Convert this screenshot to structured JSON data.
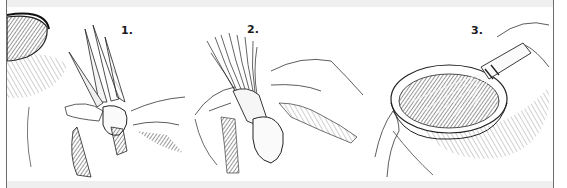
{
  "illustration": {
    "steps": [
      {
        "number": "1.",
        "subject": "hands tying husk leaves into a bundle beside a bowl"
      },
      {
        "number": "2.",
        "subject": "hands splitting the tied bundle into fine strands"
      },
      {
        "number": "3.",
        "subject": "hand holding the finished husk whisk in a bowl of sauce"
      }
    ]
  },
  "colors": {
    "ink": "#1a1a1a",
    "border": "#6e6e6e",
    "strip": "#efefef",
    "background": "#ffffff"
  }
}
